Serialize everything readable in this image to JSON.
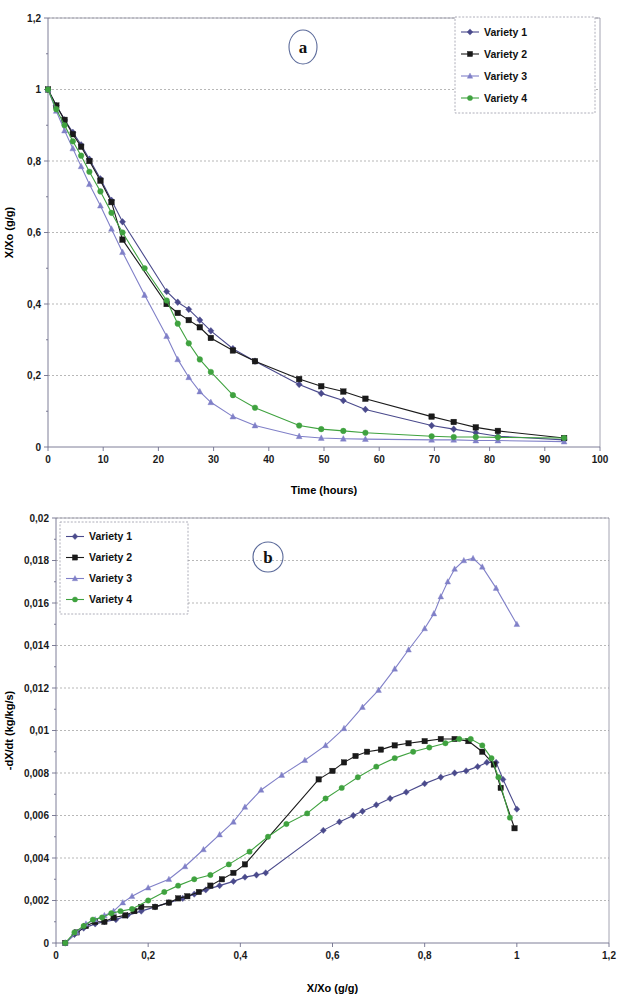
{
  "figure": {
    "panels": [
      {
        "letter": "a",
        "id": "panel-a"
      },
      {
        "letter": "b",
        "id": "panel-b"
      }
    ]
  },
  "colors": {
    "variety_1": "#4a4a8c",
    "variety_2": "#1a1a1a",
    "variety_3": "#8080c8",
    "variety_4": "#3fa23f",
    "grid": "#9a9a9a",
    "axis": "#6f6f8c",
    "text": "#111111"
  },
  "legend": {
    "items": [
      {
        "label": "Variety 1",
        "color": "#4a4a8c",
        "marker": "diamond"
      },
      {
        "label": "Variety 2",
        "color": "#1a1a1a",
        "marker": "square"
      },
      {
        "label": "Variety 3",
        "color": "#8080c8",
        "marker": "triangle"
      },
      {
        "label": "Variety 4",
        "color": "#3fa23f",
        "marker": "circle"
      }
    ]
  },
  "chart_data": [
    {
      "id": "chart-a",
      "type": "line",
      "title": "a",
      "xlabel": "Time (hours)",
      "ylabel": "X/Xo (g/g)",
      "xlim": [
        0,
        100
      ],
      "ylim": [
        0,
        1.2
      ],
      "xticks": [
        0,
        10,
        20,
        30,
        40,
        50,
        60,
        70,
        80,
        90,
        100
      ],
      "xticklabels": [
        "0",
        "10",
        "20",
        "30",
        "40",
        "50",
        "60",
        "70",
        "80",
        "90",
        "100"
      ],
      "yticks": [
        0,
        0.2,
        0.4,
        0.6,
        0.8,
        1,
        1.2
      ],
      "yticklabels": [
        "0",
        "0,2",
        "0,4",
        "0,6",
        "0,8",
        "1",
        "1,2"
      ],
      "grid": true,
      "legend_position": "top-right",
      "series": [
        {
          "name": "Variety 1",
          "color": "#4a4a8c",
          "marker": "diamond",
          "x": [
            0,
            1.5,
            3,
            4.5,
            6,
            7.5,
            9.5,
            11.5,
            13.5,
            21.5,
            23.5,
            25.5,
            27.5,
            29.5,
            33.5,
            37.5,
            45.5,
            49.5,
            53.5,
            57.5,
            69.5,
            73.5,
            77.5,
            81.5,
            93.5
          ],
          "y": [
            1.0,
            0.955,
            0.915,
            0.88,
            0.845,
            0.805,
            0.75,
            0.69,
            0.63,
            0.435,
            0.405,
            0.385,
            0.355,
            0.325,
            0.275,
            0.24,
            0.175,
            0.15,
            0.13,
            0.105,
            0.06,
            0.05,
            0.04,
            0.03,
            0.02
          ]
        },
        {
          "name": "Variety 2",
          "color": "#1a1a1a",
          "marker": "square",
          "x": [
            0,
            1.5,
            3,
            4.5,
            6,
            7.5,
            9.5,
            11.5,
            13.5,
            21.5,
            23.5,
            25.5,
            27.5,
            29.5,
            33.5,
            37.5,
            45.5,
            49.5,
            53.5,
            57.5,
            69.5,
            73.5,
            77.5,
            81.5,
            93.5
          ],
          "y": [
            1.0,
            0.955,
            0.915,
            0.875,
            0.84,
            0.8,
            0.745,
            0.685,
            0.58,
            0.4,
            0.375,
            0.355,
            0.335,
            0.305,
            0.27,
            0.24,
            0.19,
            0.17,
            0.155,
            0.135,
            0.085,
            0.07,
            0.055,
            0.045,
            0.025
          ]
        },
        {
          "name": "Variety 3",
          "color": "#8080c8",
          "marker": "triangle",
          "x": [
            0,
            1.5,
            3,
            4.5,
            6,
            7.5,
            9.5,
            11.5,
            13.5,
            17.5,
            21.5,
            23.5,
            25.5,
            27.5,
            29.5,
            33.5,
            37.5,
            45.5,
            49.5,
            53.5,
            57.5,
            69.5,
            73.5,
            77.5,
            81.5,
            93.5
          ],
          "y": [
            1.0,
            0.94,
            0.885,
            0.835,
            0.785,
            0.735,
            0.675,
            0.61,
            0.545,
            0.425,
            0.31,
            0.245,
            0.195,
            0.155,
            0.125,
            0.085,
            0.06,
            0.03,
            0.025,
            0.023,
            0.022,
            0.02,
            0.02,
            0.018,
            0.018,
            0.015
          ]
        },
        {
          "name": "Variety 4",
          "color": "#3fa23f",
          "marker": "circle",
          "x": [
            0,
            1.5,
            3,
            4.5,
            6,
            7.5,
            9.5,
            11.5,
            13.5,
            17.5,
            21.5,
            23.5,
            25.5,
            27.5,
            29.5,
            33.5,
            37.5,
            45.5,
            49.5,
            53.5,
            57.5,
            69.5,
            73.5,
            77.5,
            81.5,
            93.5
          ],
          "y": [
            1.0,
            0.945,
            0.9,
            0.855,
            0.815,
            0.77,
            0.715,
            0.655,
            0.6,
            0.5,
            0.41,
            0.345,
            0.29,
            0.245,
            0.21,
            0.145,
            0.11,
            0.06,
            0.05,
            0.045,
            0.04,
            0.03,
            0.028,
            0.028,
            0.027,
            0.025
          ]
        }
      ]
    },
    {
      "id": "chart-b",
      "type": "line",
      "title": "b",
      "xlabel": "X/Xo (g/g)",
      "ylabel": "-dX/dt  (kg/kg/s)",
      "xlim": [
        0,
        1.2
      ],
      "ylim": [
        0,
        0.02
      ],
      "xticks": [
        0,
        0.2,
        0.4,
        0.6,
        0.8,
        1,
        1.2
      ],
      "xticklabels": [
        "0",
        "0,2",
        "0,4",
        "0,6",
        "0,8",
        "1",
        "1,2"
      ],
      "yticks": [
        0,
        0.002,
        0.004,
        0.006,
        0.008,
        0.01,
        0.012,
        0.014,
        0.016,
        0.018,
        0.02
      ],
      "yticklabels": [
        "0",
        "0,002",
        "0,004",
        "0,006",
        "0,008",
        "0,01",
        "0,012",
        "0,014",
        "0,016",
        "0,018",
        "0,02"
      ],
      "grid": true,
      "legend_position": "top-left",
      "series": [
        {
          "name": "Variety 1",
          "color": "#4a4a8c",
          "marker": "diamond",
          "x": [
            0.02,
            0.04,
            0.06,
            0.085,
            0.105,
            0.13,
            0.155,
            0.185,
            0.215,
            0.245,
            0.275,
            0.3,
            0.325,
            0.355,
            0.385,
            0.41,
            0.435,
            0.455,
            0.58,
            0.615,
            0.645,
            0.665,
            0.695,
            0.725,
            0.76,
            0.8,
            0.835,
            0.865,
            0.89,
            0.915,
            0.935,
            0.955,
            0.97,
            1.0
          ],
          "y": [
            0.0,
            0.0004,
            0.0007,
            0.0009,
            0.001,
            0.0011,
            0.0013,
            0.0015,
            0.0017,
            0.0019,
            0.0021,
            0.0023,
            0.0025,
            0.0027,
            0.0029,
            0.0031,
            0.0032,
            0.0033,
            0.0053,
            0.0057,
            0.006,
            0.0062,
            0.0065,
            0.0068,
            0.0071,
            0.0075,
            0.0078,
            0.008,
            0.0081,
            0.0083,
            0.0085,
            0.0085,
            0.0077,
            0.0063
          ]
        },
        {
          "name": "Variety 2",
          "color": "#1a1a1a",
          "marker": "square",
          "x": [
            0.02,
            0.045,
            0.065,
            0.085,
            0.105,
            0.125,
            0.15,
            0.17,
            0.185,
            0.215,
            0.245,
            0.265,
            0.285,
            0.31,
            0.335,
            0.36,
            0.385,
            0.41,
            0.57,
            0.6,
            0.625,
            0.65,
            0.675,
            0.705,
            0.735,
            0.765,
            0.8,
            0.835,
            0.865,
            0.895,
            0.925,
            0.95,
            0.965,
            0.995
          ],
          "y": [
            0.0,
            0.0005,
            0.0008,
            0.001,
            0.001,
            0.0012,
            0.0013,
            0.0015,
            0.0017,
            0.0017,
            0.0019,
            0.0021,
            0.0022,
            0.0024,
            0.0027,
            0.003,
            0.0033,
            0.0037,
            0.0077,
            0.0081,
            0.0085,
            0.0088,
            0.009,
            0.0091,
            0.0093,
            0.0094,
            0.0095,
            0.0096,
            0.0096,
            0.0095,
            0.009,
            0.0084,
            0.0073,
            0.0054
          ]
        },
        {
          "name": "Variety 3",
          "color": "#8080c8",
          "marker": "triangle",
          "x": [
            0.02,
            0.045,
            0.065,
            0.085,
            0.105,
            0.125,
            0.145,
            0.165,
            0.2,
            0.245,
            0.28,
            0.32,
            0.355,
            0.385,
            0.41,
            0.445,
            0.49,
            0.54,
            0.585,
            0.625,
            0.665,
            0.7,
            0.735,
            0.765,
            0.8,
            0.82,
            0.835,
            0.85,
            0.865,
            0.885,
            0.905,
            0.925,
            0.955,
            1.0
          ],
          "y": [
            0.0,
            0.0005,
            0.0009,
            0.0011,
            0.0013,
            0.0015,
            0.0019,
            0.0022,
            0.0026,
            0.003,
            0.0036,
            0.0044,
            0.0051,
            0.0057,
            0.0064,
            0.0072,
            0.0079,
            0.0086,
            0.0093,
            0.0101,
            0.0111,
            0.0119,
            0.0129,
            0.0138,
            0.0148,
            0.0155,
            0.0163,
            0.017,
            0.0176,
            0.018,
            0.0181,
            0.0177,
            0.0167,
            0.015
          ]
        },
        {
          "name": "Variety 4",
          "color": "#3fa23f",
          "marker": "circle",
          "x": [
            0.02,
            0.04,
            0.06,
            0.08,
            0.1,
            0.12,
            0.14,
            0.165,
            0.2,
            0.235,
            0.265,
            0.3,
            0.335,
            0.375,
            0.42,
            0.46,
            0.5,
            0.545,
            0.585,
            0.62,
            0.655,
            0.695,
            0.735,
            0.775,
            0.81,
            0.845,
            0.875,
            0.9,
            0.925,
            0.945,
            0.96,
            0.985
          ],
          "y": [
            0.0,
            0.0005,
            0.0008,
            0.0011,
            0.0012,
            0.0014,
            0.0015,
            0.0016,
            0.002,
            0.0024,
            0.0027,
            0.003,
            0.0032,
            0.0037,
            0.0043,
            0.005,
            0.0056,
            0.0061,
            0.0068,
            0.0073,
            0.0078,
            0.0083,
            0.0087,
            0.009,
            0.0092,
            0.0094,
            0.0096,
            0.0096,
            0.0093,
            0.0087,
            0.0078,
            0.0059
          ]
        }
      ]
    }
  ]
}
